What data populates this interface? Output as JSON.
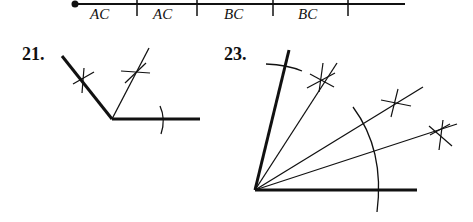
{
  "segment": {
    "labels": [
      "AC",
      "AC",
      "BC",
      "BC"
    ]
  },
  "problems": [
    {
      "number": "21."
    },
    {
      "number": "23."
    }
  ],
  "colors": {
    "ink": "#111111",
    "background": "#ffffff"
  }
}
